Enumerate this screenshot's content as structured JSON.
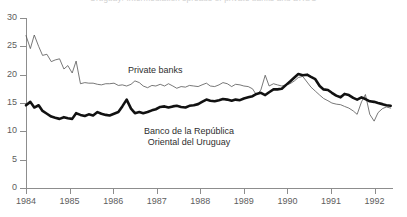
{
  "figure": {
    "title_cropped": "Uruguay: Intermediation spreads of private banks and BROU",
    "background": "#ffffff"
  },
  "annotations": {
    "private_banks": "Private banks",
    "brou_line1": "Banco de la República",
    "brou_line2": "Oriental del Uruguay"
  },
  "chart_data": {
    "type": "line",
    "title": "",
    "xlabel": "",
    "ylabel": "",
    "xlim": [
      1984,
      1992.4
    ],
    "ylim": [
      0,
      30
    ],
    "grid": false,
    "legend": "inline-annotations",
    "y_ticks": [
      0,
      5,
      10,
      15,
      20,
      25,
      30
    ],
    "x_ticks": [
      1984,
      1985,
      1986,
      1987,
      1988,
      1989,
      1990,
      1991,
      1992
    ],
    "x_tick_labels": [
      "1984",
      "1985",
      "1986",
      "1987",
      "1988",
      "1989",
      "1990",
      "1991",
      "1992"
    ],
    "colors": {
      "private_banks": "#555555",
      "brou": "#111111",
      "axis": "#8d8d8d"
    },
    "series": [
      {
        "name": "Private banks",
        "style": "thin",
        "x": [
          1984.0,
          1984.1,
          1984.19,
          1984.29,
          1984.38,
          1984.48,
          1984.58,
          1984.67,
          1984.77,
          1984.87,
          1984.96,
          1985.06,
          1985.15,
          1985.25,
          1985.35,
          1985.44,
          1985.54,
          1985.64,
          1985.73,
          1985.83,
          1985.92,
          1986.02,
          1986.12,
          1986.21,
          1986.31,
          1986.41,
          1986.5,
          1986.6,
          1986.69,
          1986.79,
          1986.89,
          1986.98,
          1987.08,
          1987.18,
          1987.27,
          1987.37,
          1987.46,
          1987.56,
          1987.66,
          1987.75,
          1987.85,
          1987.95,
          1988.04,
          1988.14,
          1988.23,
          1988.33,
          1988.43,
          1988.52,
          1988.62,
          1988.72,
          1988.81,
          1988.91,
          1989.0,
          1989.1,
          1989.2,
          1989.29,
          1989.39,
          1989.49,
          1989.58,
          1989.68,
          1989.77,
          1989.87,
          1989.97,
          1990.06,
          1990.16,
          1990.25,
          1990.35,
          1990.45,
          1990.54,
          1990.64,
          1990.74,
          1990.83,
          1990.93,
          1991.02,
          1991.12,
          1991.22,
          1991.31,
          1991.41,
          1991.51,
          1991.6,
          1991.7,
          1991.79,
          1991.89,
          1991.99,
          1992.08,
          1992.18,
          1992.27,
          1992.37
        ],
        "y": [
          26.9,
          24.6,
          27.0,
          25.0,
          23.4,
          23.6,
          22.3,
          22.6,
          22.8,
          21.0,
          21.6,
          20.3,
          22.4,
          18.4,
          18.6,
          18.5,
          18.5,
          18.3,
          18.2,
          18.4,
          18.4,
          18.5,
          18.1,
          18.2,
          18.0,
          18.3,
          18.9,
          18.6,
          18.0,
          17.7,
          18.1,
          18.0,
          18.3,
          18.0,
          18.4,
          18.0,
          17.6,
          17.9,
          17.8,
          18.1,
          18.0,
          17.9,
          18.2,
          18.5,
          18.0,
          17.9,
          18.2,
          18.6,
          18.4,
          17.9,
          18.3,
          18.2,
          18.0,
          17.9,
          17.5,
          16.4,
          17.3,
          19.9,
          18.0,
          18.4,
          18.2,
          18.0,
          18.2,
          18.4,
          18.9,
          19.5,
          19.7,
          18.7,
          17.8,
          17.1,
          16.4,
          15.8,
          15.4,
          15.0,
          14.8,
          14.7,
          14.4,
          14.1,
          13.6,
          13.0,
          15.2,
          16.5,
          13.0,
          11.8,
          13.3,
          14.0,
          14.3,
          14.1
        ]
      },
      {
        "name": "Banco de la República Oriental del Uruguay",
        "style": "bold",
        "x": [
          1984.0,
          1984.1,
          1984.19,
          1984.29,
          1984.38,
          1984.48,
          1984.58,
          1984.67,
          1984.77,
          1984.87,
          1984.96,
          1985.06,
          1985.15,
          1985.25,
          1985.35,
          1985.44,
          1985.54,
          1985.64,
          1985.73,
          1985.83,
          1985.92,
          1986.02,
          1986.12,
          1986.21,
          1986.31,
          1986.41,
          1986.5,
          1986.6,
          1986.69,
          1986.79,
          1986.89,
          1986.98,
          1987.08,
          1987.18,
          1987.27,
          1987.37,
          1987.46,
          1987.56,
          1987.66,
          1987.75,
          1987.85,
          1987.95,
          1988.04,
          1988.14,
          1988.23,
          1988.33,
          1988.43,
          1988.52,
          1988.62,
          1988.72,
          1988.81,
          1988.91,
          1989.0,
          1989.1,
          1989.2,
          1989.29,
          1989.39,
          1989.49,
          1989.58,
          1989.68,
          1989.77,
          1989.87,
          1989.97,
          1990.06,
          1990.16,
          1990.25,
          1990.35,
          1990.45,
          1990.54,
          1990.64,
          1990.74,
          1990.83,
          1990.93,
          1991.02,
          1991.12,
          1991.22,
          1991.31,
          1991.41,
          1991.51,
          1991.6,
          1991.7,
          1991.79,
          1991.89,
          1991.99,
          1992.08,
          1992.18,
          1992.27,
          1992.37
        ],
        "y": [
          14.6,
          15.2,
          14.2,
          14.6,
          13.6,
          13.1,
          12.6,
          12.4,
          12.2,
          12.5,
          12.3,
          12.2,
          13.2,
          12.9,
          12.7,
          13.0,
          12.8,
          13.4,
          13.1,
          12.9,
          12.8,
          13.1,
          13.4,
          14.4,
          15.6,
          14.0,
          13.2,
          13.4,
          13.2,
          13.4,
          13.7,
          13.9,
          14.3,
          14.4,
          14.2,
          14.4,
          14.5,
          14.3,
          14.2,
          14.5,
          14.6,
          14.8,
          15.2,
          15.6,
          15.4,
          15.3,
          15.5,
          15.7,
          15.6,
          15.4,
          15.6,
          15.5,
          15.8,
          16.0,
          16.2,
          16.6,
          16.8,
          16.4,
          16.9,
          17.4,
          17.4,
          17.5,
          18.2,
          18.8,
          19.5,
          20.1,
          19.9,
          20.0,
          19.6,
          19.2,
          18.0,
          17.4,
          17.3,
          16.8,
          16.3,
          16.0,
          16.6,
          16.4,
          15.9,
          15.6,
          16.0,
          15.7,
          15.3,
          15.2,
          15.0,
          14.8,
          14.6,
          14.5
        ]
      }
    ]
  }
}
